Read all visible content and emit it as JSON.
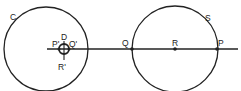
{
  "diagram": {
    "type": "geometry",
    "colors": {
      "stroke": "#222222",
      "background": "#ffffff"
    },
    "circles": [
      {
        "id": "C",
        "label": "C",
        "cx": 46,
        "cy": 49,
        "r": 42
      },
      {
        "id": "S",
        "label": "S",
        "cx": 175,
        "cy": 49,
        "r": 43
      },
      {
        "id": "small",
        "label": "",
        "cx": 64,
        "cy": 49,
        "r": 5
      }
    ],
    "line": {
      "x1": 47,
      "y1": 49,
      "x2": 238,
      "y2": 49
    },
    "points": [
      {
        "id": "Q",
        "label": "Q",
        "x": 132,
        "y": 49
      },
      {
        "id": "R",
        "label": "R",
        "x": 175,
        "y": 49
      },
      {
        "id": "P",
        "label": "P",
        "x": 217,
        "y": 49
      }
    ],
    "small_circle_labels": {
      "top": "D",
      "left": "P'",
      "right": "Q'",
      "bottom": "R'"
    }
  }
}
